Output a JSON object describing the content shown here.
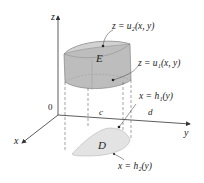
{
  "figure": {
    "axes": {
      "z_label": "z",
      "y_label": "y",
      "x_label": "x",
      "origin_label": "0"
    },
    "solid": {
      "region_label": "E",
      "top_surface": "z = u₂(x, y)",
      "bottom_surface": "z = u₁(x, y)"
    },
    "projection": {
      "region_label": "D",
      "left_curve": "x = h₁(y)",
      "right_curve": "x = h₂(y)"
    },
    "y_bounds": {
      "lower": "c",
      "upper": "d"
    },
    "colors": {
      "solid_fill": "#b9b9b9",
      "solid_top": "#cfcfcf",
      "region_fill": "#e3e3e3",
      "axis": "#333333"
    }
  }
}
